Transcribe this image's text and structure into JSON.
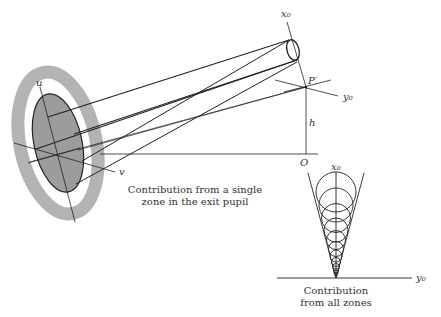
{
  "figure": {
    "labels": {
      "x0_top": "x₀",
      "p_prime": "P′",
      "y0_top": "y₀",
      "h": "h",
      "O": "O",
      "u": "u",
      "v": "v",
      "x0_bottom": "x₀",
      "y0_bottom": "y₀"
    },
    "captions": {
      "single_zone_line1": "Contribution from a single",
      "single_zone_line2": "zone in the exit pupil",
      "all_zones_line1": "Contribution",
      "all_zones_line2": "from all zones"
    },
    "colors": {
      "ink": "#222222",
      "pupil_fill": "#9a9a9a",
      "ring": "#b5b5b5",
      "background": "#ffffff"
    }
  }
}
